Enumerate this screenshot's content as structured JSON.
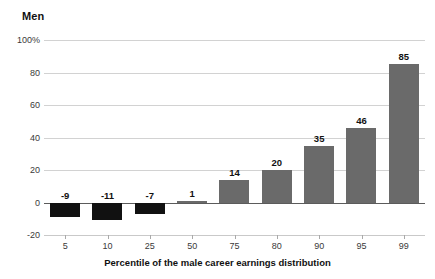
{
  "chart_data": {
    "type": "bar",
    "title": "Men",
    "xlabel": "Percentile of the male career earnings distribution",
    "ylabel": "",
    "categories": [
      "5",
      "10",
      "25",
      "50",
      "75",
      "80",
      "90",
      "95",
      "99"
    ],
    "values": [
      -9,
      -11,
      -7,
      1,
      14,
      20,
      35,
      46,
      85
    ],
    "data_labels": [
      "-9",
      "-11",
      "-7",
      "1",
      "14",
      "20",
      "35",
      "46",
      "85"
    ],
    "ylim": [
      -20,
      100
    ],
    "yticks": [
      100,
      80,
      60,
      40,
      20,
      0,
      -20
    ],
    "ytick_labels": [
      "100%",
      "80",
      "60",
      "40",
      "20",
      "0",
      "-20"
    ],
    "grid": true,
    "legend": "none",
    "colors": {
      "negative_bar": "#111111",
      "positive_bar": "#6a6a6a",
      "gridline": "#d2d2d2",
      "zero_line": "#5b5b5b",
      "text": "#111111",
      "tick_text": "#3a3a3a",
      "background": "#ffffff"
    }
  }
}
